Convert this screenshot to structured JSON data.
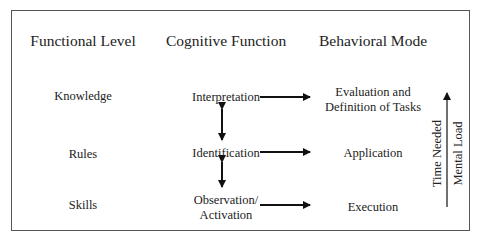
{
  "headers": {
    "functional_level": "Functional Level",
    "cognitive_function": "Cognitive Function",
    "behavioral_mode": "Behavioral Mode"
  },
  "rows": [
    {
      "level": "Knowledge",
      "cognitive": "Interpretation",
      "behavior": "Evaluation and\nDefinition of Tasks"
    },
    {
      "level": "Rules",
      "cognitive": "Identification",
      "behavior": "Application"
    },
    {
      "level": "Skills",
      "cognitive": "Observation/\nActivation",
      "behavior": "Execution"
    }
  ],
  "side_axis": {
    "label_1": "Time Needed",
    "label_2": "Mental Load",
    "direction": "up"
  },
  "colors": {
    "text": "#222222",
    "border": "#555555",
    "arrow": "#111111"
  }
}
